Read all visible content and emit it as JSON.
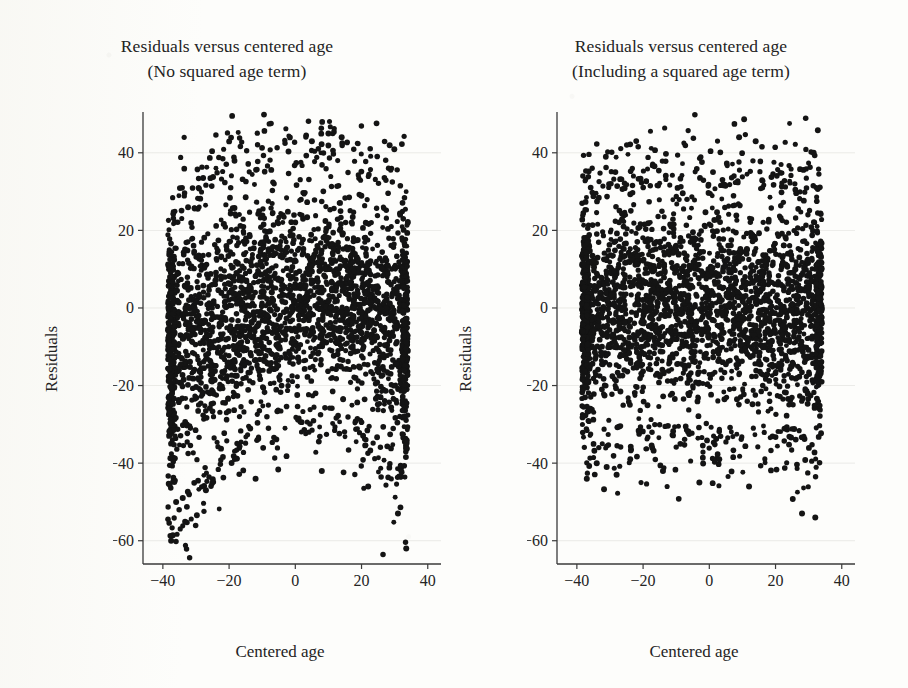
{
  "figure": {
    "background_color": "#fdfdfb",
    "point_color": "#141414",
    "axis_color": "#3a3a3a"
  },
  "panels": [
    {
      "id": "left",
      "title_line1": "Residuals versus centered age",
      "title_line2": "(No squared age term)",
      "xlabel": "Centered age",
      "ylabel": "Residuals"
    },
    {
      "id": "right",
      "title_line1": "Residuals versus centered age",
      "title_line2": "(Including a squared age term)",
      "xlabel": "Centered age",
      "ylabel": "Residuals"
    }
  ],
  "chart_data": [
    {
      "type": "scatter",
      "panel": "left",
      "title": "Residuals versus centered age (No squared age term)",
      "xlabel": "Centered age",
      "ylabel": "Residuals",
      "xlim": [
        -46,
        44
      ],
      "ylim": [
        -66,
        50
      ],
      "xticks": [
        -40,
        -20,
        0,
        20,
        40
      ],
      "xticklabels": [
        "-40",
        "-20",
        "0",
        "20",
        "40"
      ],
      "yticks": [
        40,
        20,
        0,
        -20,
        -40,
        -60
      ],
      "yticklabels": [
        "40",
        "20",
        "0",
        "-20",
        "-40",
        "-60"
      ],
      "grid": true,
      "legend": null,
      "n_points": 2600,
      "x_data_range": [
        -38.5,
        34.0
      ],
      "marker": "filled-circle",
      "description": "Dense black scatter of regression residuals against centered age. The cloud has a pronounced curved (inverted-U / arched) envelope: residual spread is shifted upward near the centre of the age range and downward at both extremes, the signature of an omitted quadratic age term.",
      "envelope": {
        "shape": "quadratic-arch",
        "upper_at_x": [
          {
            "x": -38,
            "y": 19
          },
          {
            "x": -30,
            "y": 25
          },
          {
            "x": -20,
            "y": 30
          },
          {
            "x": -10,
            "y": 34
          },
          {
            "x": 0,
            "y": 36
          },
          {
            "x": 10,
            "y": 37
          },
          {
            "x": 20,
            "y": 34
          },
          {
            "x": 30,
            "y": 30
          },
          {
            "x": 34,
            "y": 27
          }
        ],
        "lower_at_x": [
          {
            "x": -38,
            "y": -52
          },
          {
            "x": -30,
            "y": -44
          },
          {
            "x": -20,
            "y": -32
          },
          {
            "x": -10,
            "y": -27
          },
          {
            "x": 0,
            "y": -25
          },
          {
            "x": 10,
            "y": -25
          },
          {
            "x": 20,
            "y": -28
          },
          {
            "x": 30,
            "y": -37
          },
          {
            "x": 34,
            "y": -45
          }
        ],
        "core_center_at_x": [
          {
            "x": -38,
            "y": -10
          },
          {
            "x": -20,
            "y": -3
          },
          {
            "x": 0,
            "y": 3
          },
          {
            "x": 20,
            "y": 2
          },
          {
            "x": 34,
            "y": -4
          }
        ]
      },
      "notable_outliers": [
        {
          "x": -37.5,
          "y": -60
        },
        {
          "x": -36.0,
          "y": -50
        },
        {
          "x": -34.0,
          "y": -49
        },
        {
          "x": -27.0,
          "y": -47
        },
        {
          "x": -12.0,
          "y": -44
        },
        {
          "x": 8.0,
          "y": -42
        },
        {
          "x": 22.0,
          "y": -46
        },
        {
          "x": 31.0,
          "y": -53
        },
        {
          "x": 33.5,
          "y": -62
        },
        {
          "x": 10.0,
          "y": 45
        },
        {
          "x": 5.0,
          "y": 43
        },
        {
          "x": 14.0,
          "y": 44
        }
      ]
    },
    {
      "type": "scatter",
      "panel": "right",
      "title": "Residuals versus centered age (Including a squared age term)",
      "xlabel": "Centered age",
      "ylabel": "Residuals",
      "xlim": [
        -46,
        44
      ],
      "ylim": [
        -66,
        50
      ],
      "xticks": [
        -40,
        -20,
        0,
        20,
        40
      ],
      "xticklabels": [
        "-40",
        "-20",
        "0",
        "20",
        "40"
      ],
      "yticks": [
        40,
        20,
        0,
        -20,
        -40,
        -60
      ],
      "yticklabels": [
        "40",
        "20",
        "0",
        "-20",
        "-40",
        "-60"
      ],
      "grid": true,
      "legend": null,
      "n_points": 2600,
      "x_data_range": [
        -38.5,
        34.0
      ],
      "marker": "filled-circle",
      "description": "Same residuals after adding a squared age term. The cloud is now an essentially flat horizontal band centred on zero with roughly constant spread across the age range; the curvature seen in the left panel has been removed.",
      "envelope": {
        "shape": "flat-band",
        "upper_at_x": [
          {
            "x": -38,
            "y": 28
          },
          {
            "x": -20,
            "y": 30
          },
          {
            "x": 0,
            "y": 31
          },
          {
            "x": 20,
            "y": 30
          },
          {
            "x": 34,
            "y": 31
          }
        ],
        "lower_at_x": [
          {
            "x": -38,
            "y": -31
          },
          {
            "x": -20,
            "y": -30
          },
          {
            "x": 0,
            "y": -29
          },
          {
            "x": 20,
            "y": -30
          },
          {
            "x": 34,
            "y": -32
          }
        ],
        "core_center_at_x": [
          {
            "x": -38,
            "y": 0
          },
          {
            "x": -20,
            "y": 0
          },
          {
            "x": 0,
            "y": 0
          },
          {
            "x": 20,
            "y": 0
          },
          {
            "x": 34,
            "y": 0
          }
        ]
      },
      "notable_outliers": [
        {
          "x": -37.0,
          "y": -44
        },
        {
          "x": -34.0,
          "y": -40
        },
        {
          "x": -31.0,
          "y": -41
        },
        {
          "x": -28.0,
          "y": -43
        },
        {
          "x": -14.0,
          "y": -42
        },
        {
          "x": -3.0,
          "y": -45
        },
        {
          "x": 3.0,
          "y": -39
        },
        {
          "x": 12.0,
          "y": -46
        },
        {
          "x": 28.0,
          "y": -53
        },
        {
          "x": 32.0,
          "y": -54
        },
        {
          "x": 9.0,
          "y": 44
        },
        {
          "x": 14.0,
          "y": 43
        },
        {
          "x": 31.5,
          "y": 40
        }
      ]
    }
  ]
}
